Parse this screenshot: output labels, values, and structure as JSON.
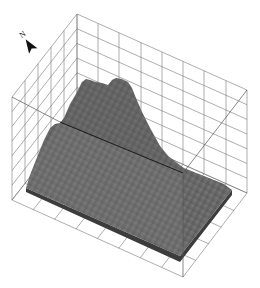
{
  "figure": {
    "type": "3d-terrain-surface-in-wireframe-box",
    "orientation": {
      "north_arrow_label": "N"
    },
    "colors": {
      "background": "#ffffff",
      "grid": "#6a6a6a",
      "surface_light": "#8a8a8a",
      "surface_mid": "#6e6e6e",
      "surface_dark": "#4a4a4a",
      "edge_dark": "#1a1a1a"
    },
    "caption": ""
  }
}
